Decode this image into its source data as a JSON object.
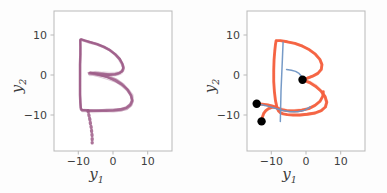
{
  "figure": {
    "background_color": "#fdfdfd",
    "panel_count": 2,
    "axis_color": "#b9b9b9",
    "tick_text_color": "#3f3f3f"
  },
  "chart_data": [
    {
      "type": "line",
      "panel": "left",
      "title": "",
      "xlabel": "y1",
      "ylabel": "y2",
      "xlim": [
        -17,
        17
      ],
      "ylim": [
        -19,
        16
      ],
      "xticks": [
        -10,
        0,
        10
      ],
      "yticks": [
        -10,
        0,
        10
      ],
      "xticklabels": [
        "−10",
        "0",
        "10"
      ],
      "yticklabels": [
        "−10",
        "0",
        "10"
      ],
      "grid": false,
      "legend": false,
      "legend_position": "none",
      "series_color": "#9c5a86",
      "series_count": 12,
      "description": "Overlaid handwriting trajectories forming the letter B, purple",
      "series": [
        {
          "name": "trajectory-1",
          "color": "#9c5a86",
          "points": [
            [
              -9.4,
              8.8
            ],
            [
              -9.2,
              8.9
            ],
            [
              -8.2,
              8.6
            ],
            [
              -6.6,
              8.2
            ],
            [
              -4.6,
              7.7
            ],
            [
              -2.6,
              7.0
            ],
            [
              -0.9,
              6.2
            ],
            [
              0.6,
              5.2
            ],
            [
              1.9,
              4.0
            ],
            [
              2.7,
              2.8
            ],
            [
              3.0,
              1.8
            ],
            [
              2.7,
              1.0
            ],
            [
              1.9,
              0.5
            ],
            [
              0.6,
              0.2
            ],
            [
              -1.1,
              0.1
            ],
            [
              -2.8,
              0.2
            ],
            [
              -4.3,
              0.3
            ],
            [
              -5.5,
              0.4
            ],
            [
              -6.3,
              0.4
            ],
            [
              -6.8,
              0.4
            ],
            [
              -5.8,
              0.3
            ],
            [
              -3.8,
              0.0
            ],
            [
              -1.6,
              -0.5
            ],
            [
              0.6,
              -1.3
            ],
            [
              2.6,
              -2.4
            ],
            [
              4.2,
              -3.7
            ],
            [
              5.2,
              -5.1
            ],
            [
              5.5,
              -6.4
            ],
            [
              5.0,
              -7.4
            ],
            [
              3.8,
              -8.2
            ],
            [
              2.1,
              -8.6
            ],
            [
              0.1,
              -8.8
            ],
            [
              -2.0,
              -8.9
            ],
            [
              -4.0,
              -8.9
            ],
            [
              -5.7,
              -8.9
            ],
            [
              -7.0,
              -8.9
            ],
            [
              -8.0,
              -8.8
            ],
            [
              -8.6,
              -8.8
            ],
            [
              -9.0,
              -8.8
            ],
            [
              -9.2,
              -8.6
            ],
            [
              -9.3,
              -8.2
            ],
            [
              -9.4,
              -7.0
            ],
            [
              -9.5,
              -5.0
            ],
            [
              -9.5,
              -2.6
            ],
            [
              -9.5,
              0.0
            ],
            [
              -9.5,
              2.6
            ],
            [
              -9.4,
              5.0
            ],
            [
              -9.4,
              7.0
            ],
            [
              -9.4,
              8.2
            ],
            [
              -9.4,
              8.8
            ]
          ]
        },
        {
          "name": "trajectory-tail",
          "color": "#9c5a86",
          "style": "dotted-stroke",
          "points": [
            [
              -7.2,
              -8.9
            ],
            [
              -7.0,
              -9.8
            ],
            [
              -6.8,
              -10.6
            ],
            [
              -6.6,
              -11.4
            ],
            [
              -6.5,
              -12.2
            ],
            [
              -6.3,
              -13.0
            ],
            [
              -6.2,
              -13.8
            ],
            [
              -6.1,
              -14.6
            ],
            [
              -6.0,
              -15.4
            ],
            [
              -6.0,
              -16.2
            ],
            [
              -6.0,
              -17.0
            ]
          ]
        }
      ]
    },
    {
      "type": "line",
      "panel": "right",
      "title": "",
      "xlabel": "y1",
      "ylabel": "y2",
      "xlim": [
        -17,
        17
      ],
      "ylim": [
        -19,
        16
      ],
      "xticks": [
        -10,
        0,
        10
      ],
      "yticks": [
        -10,
        0,
        10
      ],
      "xticklabels": [
        "−10",
        "0",
        "10"
      ],
      "yticklabels": [
        "−10",
        "0",
        "10"
      ],
      "grid": false,
      "legend": false,
      "legend_position": "none",
      "series_color": "#f4603e",
      "secondary_color": "#6f95c4",
      "marker_color": "#000000",
      "description": "Generated handwriting trajectories forming the letter B, orange-red, with blue guide segments and black start markers",
      "series": [
        {
          "name": "trajectory-orange",
          "color": "#f4603e",
          "points": [
            [
              -8.6,
              8.6
            ],
            [
              -7.4,
              8.6
            ],
            [
              -5.4,
              8.3
            ],
            [
              -3.2,
              7.9
            ],
            [
              -1.0,
              7.2
            ],
            [
              1.0,
              6.3
            ],
            [
              2.7,
              5.2
            ],
            [
              4.0,
              3.9
            ],
            [
              4.6,
              2.6
            ],
            [
              4.4,
              1.4
            ],
            [
              3.4,
              0.4
            ],
            [
              1.9,
              -0.3
            ],
            [
              0.4,
              -0.8
            ],
            [
              -0.6,
              -1.1
            ],
            [
              -1.0,
              -1.2
            ],
            [
              -0.4,
              -1.4
            ],
            [
              1.0,
              -1.9
            ],
            [
              2.7,
              -2.8
            ],
            [
              4.3,
              -4.0
            ],
            [
              5.5,
              -5.4
            ],
            [
              6.0,
              -6.8
            ],
            [
              5.6,
              -8.0
            ],
            [
              4.4,
              -8.9
            ],
            [
              2.6,
              -9.5
            ],
            [
              0.4,
              -9.8
            ],
            [
              -1.8,
              -10.0
            ],
            [
              -3.8,
              -10.0
            ],
            [
              -5.4,
              -9.9
            ],
            [
              -6.6,
              -9.7
            ],
            [
              -7.4,
              -9.4
            ],
            [
              -8.0,
              -8.9
            ],
            [
              -8.4,
              -8.0
            ],
            [
              -8.8,
              -6.4
            ],
            [
              -9.1,
              -4.2
            ],
            [
              -9.3,
              -1.6
            ],
            [
              -9.3,
              1.2
            ],
            [
              -9.2,
              3.8
            ],
            [
              -9.0,
              6.0
            ],
            [
              -8.8,
              7.6
            ],
            [
              -8.6,
              8.6
            ]
          ]
        },
        {
          "name": "trajectory-orange-branch",
          "color": "#f4603e",
          "points": [
            [
              -14.2,
              -7.2
            ],
            [
              -12.6,
              -7.3
            ],
            [
              -11.0,
              -7.5
            ],
            [
              -9.6,
              -7.8
            ],
            [
              -8.4,
              -8.2
            ],
            [
              -7.2,
              -8.6
            ],
            [
              -5.6,
              -8.9
            ],
            [
              -3.4,
              -9.0
            ],
            [
              -1.2,
              -8.8
            ],
            [
              0.8,
              -8.4
            ],
            [
              2.6,
              -7.6
            ],
            [
              4.0,
              -6.6
            ],
            [
              4.8,
              -5.4
            ],
            [
              5.0,
              -4.2
            ]
          ]
        },
        {
          "name": "trajectory-orange-stub",
          "color": "#f4603e",
          "points": [
            [
              -12.8,
              -11.6
            ],
            [
              -12.6,
              -10.6
            ],
            [
              -12.2,
              -9.6
            ],
            [
              -11.6,
              -8.9
            ],
            [
              -10.8,
              -8.4
            ],
            [
              -9.8,
              -8.1
            ],
            [
              -8.8,
              -8.0
            ]
          ]
        },
        {
          "name": "guide-line-vertical",
          "color": "#6f95c4",
          "points": [
            [
              -6.6,
              8.2
            ],
            [
              -6.8,
              4.0
            ],
            [
              -7.0,
              0.0
            ],
            [
              -7.2,
              -4.0
            ],
            [
              -7.3,
              -8.0
            ],
            [
              -7.4,
              -11.6
            ]
          ]
        },
        {
          "name": "guide-line-horizontal",
          "color": "#6f95c4",
          "points": [
            [
              -5.6,
              1.4
            ],
            [
              -4.2,
              1.2
            ],
            [
              -3.0,
              0.9
            ],
            [
              -2.0,
              0.4
            ],
            [
              -1.3,
              -0.3
            ],
            [
              -1.0,
              -1.0
            ]
          ]
        },
        {
          "name": "guide-line-lower",
          "color": "#6f95c4",
          "points": [
            [
              -14.2,
              -7.2
            ],
            [
              -11.8,
              -7.6
            ],
            [
              -9.4,
              -8.2
            ],
            [
              -7.0,
              -8.8
            ],
            [
              -4.6,
              -9.2
            ],
            [
              -2.4,
              -9.2
            ],
            [
              -0.4,
              -8.8
            ],
            [
              1.2,
              -8.0
            ]
          ]
        }
      ],
      "markers": [
        {
          "name": "start-marker-1",
          "x": -14.2,
          "y": -7.2,
          "color": "#000000",
          "size": 4.2
        },
        {
          "name": "start-marker-2",
          "x": -12.8,
          "y": -11.6,
          "color": "#000000",
          "size": 4.2
        },
        {
          "name": "start-marker-3",
          "x": -1.0,
          "y": -1.2,
          "color": "#000000",
          "size": 4.2
        }
      ]
    }
  ],
  "panels": [
    {
      "id": "panel-left",
      "name": "left-plot-panel",
      "xlabel_html": "y<sub>1</sub>",
      "ylabel_html": "y<sub>2</sub>",
      "xtick_labels": [
        "−10",
        "0",
        "10"
      ],
      "ytick_labels": [
        "10",
        "0",
        "−10"
      ]
    },
    {
      "id": "panel-right",
      "name": "right-plot-panel",
      "xlabel_html": "y<sub>1</sub>",
      "ylabel_html": "y<sub>2</sub>",
      "xtick_labels": [
        "−10",
        "0",
        "10"
      ],
      "ytick_labels": [
        "10",
        "0",
        "−10"
      ]
    }
  ]
}
